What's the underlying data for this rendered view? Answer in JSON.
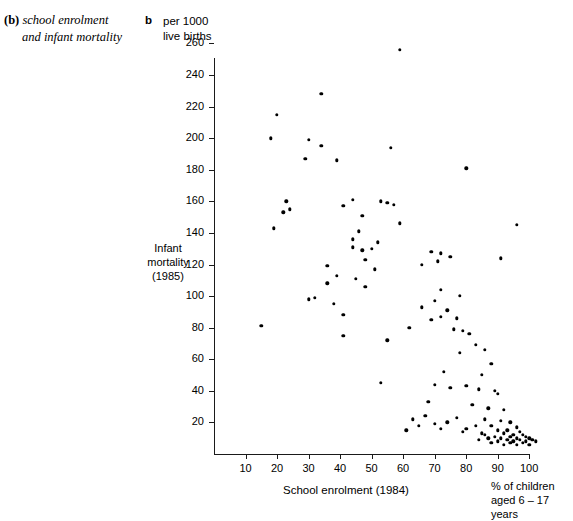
{
  "caption": {
    "tag": "(b)",
    "line1": "school enrolment",
    "line2": "and infant mortality"
  },
  "panel": {
    "letter": "b"
  },
  "units": {
    "line1": "per 1000",
    "line2": "live births"
  },
  "axis_titles": {
    "y_line1": "Infant",
    "y_line2": "mortality",
    "y_line3": "(1985)",
    "x": "School enrolment (1984)",
    "x_note_line1": "% of children",
    "x_note_line2": "aged 6 – 17 years"
  },
  "chart_data": {
    "type": "scatter",
    "title": "",
    "xlabel": "School enrolment (1984)",
    "ylabel": "Infant mortality (1985)",
    "x_unit_note": "% of children aged 6 – 17 years",
    "y_unit_note": "per 1000 live births",
    "xlim": [
      0,
      104
    ],
    "ylim": [
      0,
      266
    ],
    "xticks": [
      10,
      20,
      30,
      40,
      50,
      60,
      70,
      80,
      90,
      100
    ],
    "yticks": [
      20,
      40,
      60,
      80,
      100,
      120,
      140,
      160,
      180,
      200,
      220,
      240,
      260
    ],
    "grid": false,
    "legend": false,
    "marker_color": "#000000",
    "points": [
      [
        59,
        256
      ],
      [
        34,
        228
      ],
      [
        20,
        215
      ],
      [
        18,
        200
      ],
      [
        30,
        199
      ],
      [
        34,
        195
      ],
      [
        56,
        194
      ],
      [
        29,
        187
      ],
      [
        39,
        186
      ],
      [
        80,
        181
      ],
      [
        44,
        161
      ],
      [
        53,
        160
      ],
      [
        23,
        160
      ],
      [
        55,
        159
      ],
      [
        57,
        158
      ],
      [
        41,
        157
      ],
      [
        24,
        155
      ],
      [
        22,
        153
      ],
      [
        47,
        151
      ],
      [
        59,
        146
      ],
      [
        96,
        145
      ],
      [
        19,
        143
      ],
      [
        46,
        141
      ],
      [
        44,
        136
      ],
      [
        52,
        134
      ],
      [
        44,
        131
      ],
      [
        50,
        130
      ],
      [
        47,
        129
      ],
      [
        69,
        128
      ],
      [
        72,
        127
      ],
      [
        75,
        125
      ],
      [
        91,
        124
      ],
      [
        48,
        123
      ],
      [
        71,
        122
      ],
      [
        66,
        120
      ],
      [
        36,
        119
      ],
      [
        51,
        117
      ],
      [
        39,
        113
      ],
      [
        45,
        111
      ],
      [
        36,
        108
      ],
      [
        48,
        106
      ],
      [
        72,
        104
      ],
      [
        78,
        100
      ],
      [
        32,
        99
      ],
      [
        30,
        98
      ],
      [
        70,
        97
      ],
      [
        38,
        95
      ],
      [
        66,
        93
      ],
      [
        74,
        91
      ],
      [
        41,
        88
      ],
      [
        72,
        87
      ],
      [
        77,
        86
      ],
      [
        69,
        85
      ],
      [
        15,
        81
      ],
      [
        62,
        80
      ],
      [
        76,
        79
      ],
      [
        79,
        78
      ],
      [
        81,
        76
      ],
      [
        41,
        75
      ],
      [
        55,
        72
      ],
      [
        83,
        69
      ],
      [
        86,
        66
      ],
      [
        78,
        64
      ],
      [
        88,
        57
      ],
      [
        73,
        52
      ],
      [
        85,
        50
      ],
      [
        53,
        45
      ],
      [
        70,
        44
      ],
      [
        80,
        43
      ],
      [
        75,
        42
      ],
      [
        84,
        41
      ],
      [
        89,
        40
      ],
      [
        90,
        38
      ],
      [
        68,
        33
      ],
      [
        82,
        31
      ],
      [
        87,
        29
      ],
      [
        92,
        28
      ],
      [
        67,
        24
      ],
      [
        77,
        23
      ],
      [
        86,
        22
      ],
      [
        91,
        21
      ],
      [
        94,
        20
      ],
      [
        70,
        19
      ],
      [
        83,
        18
      ],
      [
        88,
        18
      ],
      [
        96,
        17
      ],
      [
        72,
        16
      ],
      [
        80,
        16
      ],
      [
        90,
        15
      ],
      [
        93,
        15
      ],
      [
        97,
        14
      ],
      [
        85,
        13
      ],
      [
        92,
        13
      ],
      [
        95,
        12
      ],
      [
        98,
        12
      ],
      [
        89,
        11
      ],
      [
        94,
        11
      ],
      [
        99,
        11
      ],
      [
        87,
        10
      ],
      [
        91,
        10
      ],
      [
        96,
        10
      ],
      [
        100,
        10
      ],
      [
        93,
        9
      ],
      [
        97,
        9
      ],
      [
        84,
        9
      ],
      [
        95,
        8
      ],
      [
        99,
        8
      ],
      [
        90,
        8
      ],
      [
        101,
        9
      ],
      [
        98,
        7
      ],
      [
        94,
        7
      ],
      [
        92,
        6
      ],
      [
        96,
        6
      ],
      [
        100,
        6
      ],
      [
        88,
        7
      ],
      [
        102,
        8
      ],
      [
        86,
        12
      ],
      [
        79,
        14
      ],
      [
        74,
        20
      ],
      [
        65,
        18
      ],
      [
        63,
        22
      ],
      [
        61,
        15
      ]
    ]
  }
}
